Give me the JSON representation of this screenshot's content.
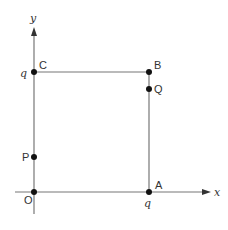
{
  "diagram": {
    "type": "coordinate-square",
    "axes": {
      "x_label": "x",
      "y_label": "y"
    },
    "tick_labels": {
      "x": "q",
      "y": "q"
    },
    "points": [
      {
        "name": "O",
        "label": "O"
      },
      {
        "name": "A",
        "label": "A"
      },
      {
        "name": "B",
        "label": "B"
      },
      {
        "name": "C",
        "label": "C"
      },
      {
        "name": "P",
        "label": "P"
      },
      {
        "name": "Q",
        "label": "Q"
      }
    ],
    "colors": {
      "line": "#777777",
      "point": "#111111",
      "text": "#333333"
    }
  }
}
